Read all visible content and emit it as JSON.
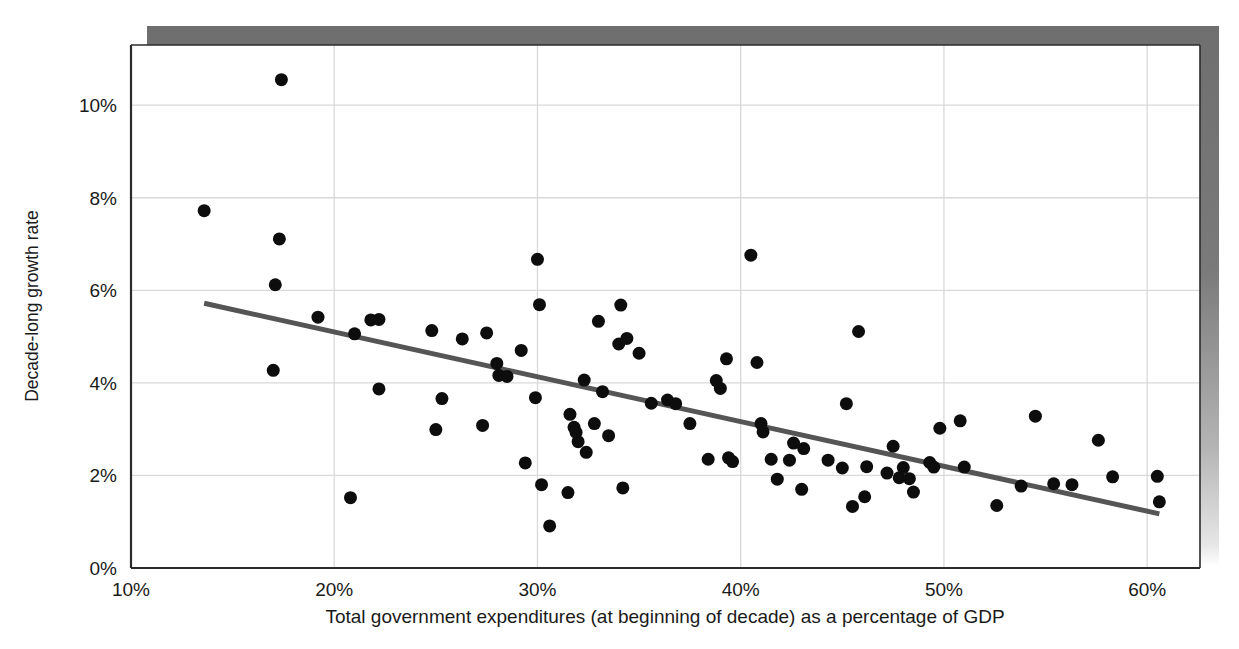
{
  "chart_data": {
    "type": "scatter",
    "title": "",
    "xlabel": "Total government expenditures (at beginning of decade) as a percentage of GDP",
    "ylabel": "Decade-long growth rate",
    "xlim": [
      10,
      62.6
    ],
    "ylim": [
      0,
      11.3
    ],
    "xticks": [
      10,
      20,
      30,
      40,
      50,
      60
    ],
    "xtick_labels": [
      "10%",
      "20%",
      "30%",
      "40%",
      "50%",
      "60%"
    ],
    "yticks": [
      0,
      2,
      4,
      6,
      8,
      10
    ],
    "ytick_labels": [
      "0%",
      "2%",
      "4%",
      "6%",
      "8%",
      "10%"
    ],
    "grid": true,
    "legend": "none",
    "marker_color": "#0d0d0d",
    "marker_size_px": 13,
    "trendline": {
      "label": "linear fit",
      "color": "#555555",
      "width_px": 5,
      "x_start": 13.6,
      "y_start": 5.72,
      "x_end": 60.6,
      "y_end": 1.17
    },
    "points": [
      [
        17.4,
        10.55
      ],
      [
        13.6,
        7.72
      ],
      [
        17.3,
        7.11
      ],
      [
        17.1,
        6.12
      ],
      [
        17.0,
        4.27
      ],
      [
        19.2,
        5.42
      ],
      [
        21.0,
        5.06
      ],
      [
        21.8,
        5.36
      ],
      [
        22.2,
        5.37
      ],
      [
        22.2,
        3.87
      ],
      [
        20.8,
        1.52
      ],
      [
        24.8,
        5.13
      ],
      [
        25.3,
        3.66
      ],
      [
        25.0,
        2.99
      ],
      [
        26.3,
        4.95
      ],
      [
        27.5,
        5.08
      ],
      [
        27.3,
        3.08
      ],
      [
        28.0,
        4.42
      ],
      [
        28.1,
        4.16
      ],
      [
        28.5,
        4.14
      ],
      [
        29.2,
        4.7
      ],
      [
        29.4,
        2.27
      ],
      [
        30.0,
        6.67
      ],
      [
        30.1,
        5.69
      ],
      [
        29.9,
        3.68
      ],
      [
        30.2,
        1.8
      ],
      [
        30.6,
        0.91
      ],
      [
        31.5,
        1.63
      ],
      [
        31.6,
        3.32
      ],
      [
        31.8,
        3.04
      ],
      [
        31.9,
        2.93
      ],
      [
        32.0,
        2.73
      ],
      [
        32.3,
        4.06
      ],
      [
        32.4,
        2.5
      ],
      [
        32.8,
        3.12
      ],
      [
        33.0,
        5.33
      ],
      [
        33.2,
        3.81
      ],
      [
        33.5,
        2.86
      ],
      [
        34.1,
        5.68
      ],
      [
        34.0,
        4.84
      ],
      [
        34.4,
        4.96
      ],
      [
        34.2,
        1.73
      ],
      [
        35.0,
        4.64
      ],
      [
        35.6,
        3.56
      ],
      [
        36.4,
        3.63
      ],
      [
        36.8,
        3.55
      ],
      [
        37.5,
        3.12
      ],
      [
        38.4,
        2.35
      ],
      [
        38.8,
        4.05
      ],
      [
        39.0,
        3.88
      ],
      [
        39.3,
        4.52
      ],
      [
        39.4,
        2.38
      ],
      [
        39.6,
        2.3
      ],
      [
        40.5,
        6.76
      ],
      [
        40.8,
        4.44
      ],
      [
        41.0,
        3.12
      ],
      [
        41.1,
        2.94
      ],
      [
        41.5,
        2.35
      ],
      [
        41.8,
        1.92
      ],
      [
        42.4,
        2.33
      ],
      [
        42.6,
        2.7
      ],
      [
        43.1,
        2.58
      ],
      [
        43.0,
        1.7
      ],
      [
        44.3,
        2.33
      ],
      [
        45.0,
        2.16
      ],
      [
        45.2,
        3.55
      ],
      [
        45.5,
        1.33
      ],
      [
        45.8,
        5.11
      ],
      [
        46.2,
        2.19
      ],
      [
        46.1,
        1.54
      ],
      [
        47.2,
        2.05
      ],
      [
        47.5,
        2.63
      ],
      [
        47.8,
        1.95
      ],
      [
        48.0,
        2.17
      ],
      [
        48.3,
        1.93
      ],
      [
        48.5,
        1.64
      ],
      [
        49.3,
        2.28
      ],
      [
        49.5,
        2.18
      ],
      [
        49.8,
        3.02
      ],
      [
        50.8,
        3.18
      ],
      [
        51.0,
        2.18
      ],
      [
        52.6,
        1.35
      ],
      [
        53.8,
        1.77
      ],
      [
        54.5,
        3.28
      ],
      [
        55.4,
        1.82
      ],
      [
        56.3,
        1.8
      ],
      [
        57.6,
        2.76
      ],
      [
        58.3,
        1.97
      ],
      [
        60.5,
        1.98
      ],
      [
        60.6,
        1.43
      ]
    ]
  },
  "axes": {
    "y_title": "Decade-long growth rate",
    "x_title": "Total government expenditures (at beginning of decade) as a percentage of GDP"
  }
}
